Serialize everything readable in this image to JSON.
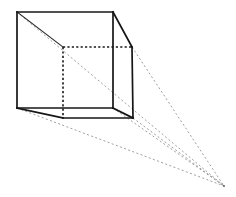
{
  "figure": {
    "type": "line-drawing",
    "canvas": {
      "width": 236,
      "height": 197,
      "background": "#ffffff"
    },
    "colors": {
      "visible_edge": "#161616",
      "hidden_edge": "#1a1a1a",
      "construction_ray": "#8d8d8d",
      "background": "#ffffff"
    },
    "vanishing_point": {
      "label": "VP",
      "x": 224,
      "y": 186
    },
    "vertices": {
      "front_top_left": {
        "x": 17,
        "y": 12
      },
      "front_top_right": {
        "x": 113,
        "y": 12
      },
      "front_bottom_right": {
        "x": 113,
        "y": 108
      },
      "front_bottom_left": {
        "x": 17,
        "y": 108
      },
      "back_top_left": {
        "x": 63,
        "y": 47
      },
      "back_top_right": {
        "x": 132,
        "y": 47
      },
      "back_bottom_right": {
        "x": 133,
        "y": 118
      },
      "back_bottom_left": {
        "x": 63,
        "y": 118
      }
    },
    "edges_solid": [
      {
        "name": "front-face-top",
        "x1": 17,
        "y1": 12,
        "x2": 113,
        "y2": 12
      },
      {
        "name": "front-face-right",
        "x1": 113,
        "y1": 12,
        "x2": 113,
        "y2": 108
      },
      {
        "name": "front-face-bottom",
        "x1": 113,
        "y1": 108,
        "x2": 17,
        "y2": 108
      },
      {
        "name": "front-face-left",
        "x1": 17,
        "y1": 108,
        "x2": 17,
        "y2": 12
      },
      {
        "name": "receding-top-right",
        "x1": 113,
        "y1": 12,
        "x2": 132,
        "y2": 47
      },
      {
        "name": "back-face-right",
        "x1": 132,
        "y1": 47,
        "x2": 133,
        "y2": 118
      },
      {
        "name": "receding-bottom-right",
        "x1": 113,
        "y1": 108,
        "x2": 133,
        "y2": 118
      },
      {
        "name": "receding-bottom-left",
        "x1": 17,
        "y1": 108,
        "x2": 63,
        "y2": 118
      },
      {
        "name": "back-face-bottom",
        "x1": 63,
        "y1": 118,
        "x2": 133,
        "y2": 118
      }
    ],
    "edges_thin": [
      {
        "name": "receding-top-left",
        "x1": 17,
        "y1": 12,
        "x2": 63,
        "y2": 47
      }
    ],
    "edges_hidden": [
      {
        "name": "back-face-top",
        "x1": 63,
        "y1": 47,
        "x2": 132,
        "y2": 47
      },
      {
        "name": "back-face-left-vertical",
        "x1": 63,
        "y1": 47,
        "x2": 63,
        "y2": 118
      }
    ],
    "construction_rays": [
      {
        "name": "ray-front-top-left-to-vp",
        "x1": 17,
        "y1": 12,
        "x2": 224,
        "y2": 186
      },
      {
        "name": "ray-back-top-right-to-vp",
        "x1": 132,
        "y1": 47,
        "x2": 224,
        "y2": 186
      },
      {
        "name": "ray-front-bottom-right-to-vp",
        "x1": 113,
        "y1": 108,
        "x2": 224,
        "y2": 186
      },
      {
        "name": "ray-back-bottom-right-to-vp",
        "x1": 133,
        "y1": 118,
        "x2": 224,
        "y2": 186
      },
      {
        "name": "ray-front-bottom-left-to-vp",
        "x1": 17,
        "y1": 108,
        "x2": 224,
        "y2": 186
      }
    ]
  }
}
